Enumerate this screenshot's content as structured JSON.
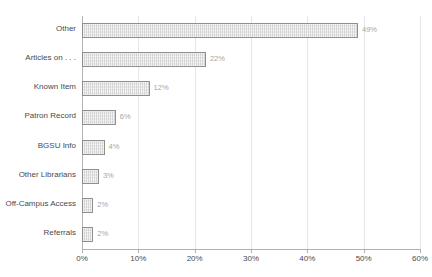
{
  "chart_data": {
    "type": "bar",
    "orientation": "horizontal",
    "title": "",
    "clipped_title_remnant": "",
    "xlabel": "",
    "ylabel": "",
    "xlim": [
      0,
      60
    ],
    "xtick_labels": [
      "0%",
      "10%",
      "20%",
      "30%",
      "40%",
      "50%",
      "60%"
    ],
    "xticks": [
      0,
      10,
      20,
      30,
      40,
      50,
      60
    ],
    "grid": "vertical",
    "legend": "none",
    "categories": [
      "Other",
      "Articles on . . .",
      "Known Item",
      "Patron Record",
      "BGSU Info",
      "Other Librarians",
      "Off-Campus Access",
      "Referrals"
    ],
    "values": [
      49,
      22,
      12,
      6,
      4,
      3,
      2,
      2
    ],
    "data_labels": [
      "49%",
      "22%",
      "12%",
      "6%",
      "4%",
      "3%",
      "2%",
      "2%"
    ],
    "colors": {
      "bar_fill": "#d2d2d2",
      "bar_border": "#8f8f8f",
      "gridline": "#e6e6e6",
      "axis": "#b0b0b0",
      "label_text": "#4a4a4a",
      "value_text": "#a6a6a6",
      "background": "#ffffff"
    }
  }
}
